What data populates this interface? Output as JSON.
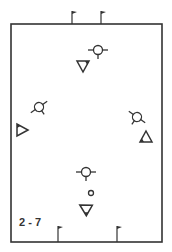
{
  "diagram": {
    "label": "2 - 7",
    "colors": {
      "stroke": "#333333",
      "background": "#ffffff"
    },
    "field": {
      "x": 11,
      "y": 24,
      "width": 151,
      "height": 218
    },
    "flags": [
      {
        "name": "top-left-flag",
        "x": 72,
        "y": 24,
        "side": "top"
      },
      {
        "name": "top-right-flag",
        "x": 101,
        "y": 24,
        "side": "top"
      },
      {
        "name": "bottom-left-flag",
        "x": 58,
        "y": 242,
        "side": "bottom"
      },
      {
        "name": "bottom-right-flag",
        "x": 117,
        "y": 242,
        "side": "bottom"
      }
    ],
    "attackers": [
      {
        "name": "attacker-top",
        "x": 98,
        "y": 50,
        "rotation": 0
      },
      {
        "name": "attacker-left",
        "x": 39,
        "y": 107,
        "rotation": -35
      },
      {
        "name": "attacker-right",
        "x": 137,
        "y": 117,
        "rotation": 35
      },
      {
        "name": "attacker-bottom",
        "x": 86,
        "y": 172,
        "rotation": 0
      }
    ],
    "defenders": [
      {
        "name": "defender-top",
        "x": 83,
        "y": 66,
        "rotation": 180
      },
      {
        "name": "defender-left",
        "x": 22,
        "y": 130,
        "rotation": 90
      },
      {
        "name": "defender-right",
        "x": 146,
        "y": 137,
        "rotation": 0
      },
      {
        "name": "defender-bottom",
        "x": 85,
        "y": 208,
        "rotation": -60
      }
    ],
    "ball": {
      "x": 91,
      "y": 193,
      "r": 2.5
    }
  }
}
